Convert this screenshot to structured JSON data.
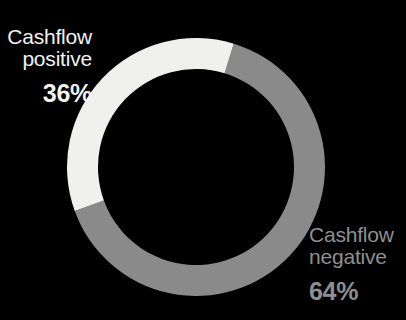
{
  "background_color": "#000000",
  "chart_data": {
    "type": "pie",
    "variant": "donut",
    "title": "",
    "subtitle": "",
    "xlabel": "",
    "ylabel": "",
    "legend_position": "outside-labels",
    "grid": false,
    "center": {
      "x": 196,
      "y": 167
    },
    "outer_radius": 129,
    "ring_thickness": 31,
    "start_angle_deg": 17,
    "direction": "clockwise",
    "total": 100,
    "unit": "%",
    "categories": [
      "Cashflow negative",
      "Cashflow positive"
    ],
    "values": [
      64,
      36
    ],
    "slices": [
      {
        "name": "Cashflow negative",
        "label_line1": "Cashflow",
        "label_line2": "negative",
        "value": 64,
        "value_label": "64%",
        "color": "#8a8a8a",
        "text_color": "#8f8f8f",
        "start_angle_deg": 17,
        "end_angle_deg": 250
      },
      {
        "name": "Cashflow positive",
        "label_line1": "Cashflow",
        "label_line2": "positive",
        "value": 36,
        "value_label": "36%",
        "color": "#f0f0ee",
        "text_color": "#f2f2f0",
        "start_angle_deg": 250,
        "end_angle_deg": 377
      }
    ]
  },
  "labels": {
    "positive": {
      "line1": "Cashflow",
      "line2": "positive",
      "percent": "36%"
    },
    "negative": {
      "line1": "Cashflow",
      "line2": "negative",
      "percent": "64%"
    }
  }
}
